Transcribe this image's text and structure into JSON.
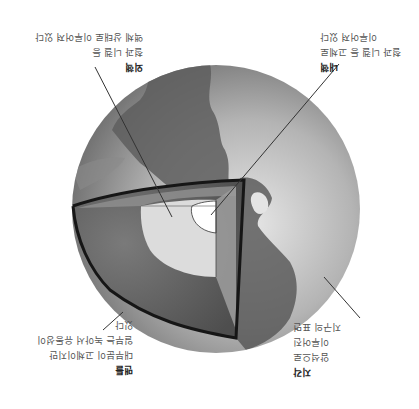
{
  "figure": {
    "orientation": "rotated 180 degrees",
    "colors": {
      "background": "#ffffff",
      "ocean": "#9a9a9a",
      "land": "#6a6a6a",
      "mantle": "#5e5e5e",
      "outer_core": "#d8d8d8",
      "inner_core": "#ffffff",
      "crust_rim": "#1a1a1a",
      "leader_line": "#333333",
      "label_text": "#555555",
      "label_title": "#222222"
    }
  },
  "labels": {
    "outer_core": {
      "title": "외핵",
      "lines": [
        "철과 니켈 등",
        "액체 상태로 이루어져 있다"
      ]
    },
    "inner_core": {
      "title": "내핵",
      "lines": [
        "철과 니켈 등 고체로",
        "이루어져 있다"
      ]
    },
    "mantle": {
      "title": "맨틀",
      "lines": [
        "대부분이 고체이지만",
        "일부는 녹아서 유동성이",
        "있다"
      ]
    },
    "crust": {
      "title": "지각",
      "lines": [
        "암석으로",
        "이루어진",
        "지구의 표면"
      ]
    }
  },
  "icons": {
    "globe": "earth-cutaway-icon"
  }
}
